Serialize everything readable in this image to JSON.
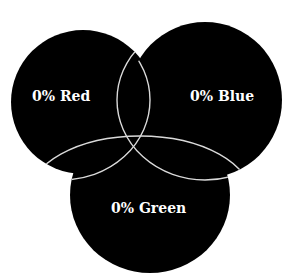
{
  "diagram": {
    "type": "venn",
    "sets": [
      {
        "name": "Red",
        "label": "0% Red",
        "value": "0%"
      },
      {
        "name": "Blue",
        "label": "0% Blue",
        "value": "0%"
      },
      {
        "name": "Green",
        "label": "0% Green",
        "value": "0%"
      }
    ],
    "fill_color": "#000000",
    "outline_color": "#d9d9d9",
    "background_color": "#ffffff"
  }
}
